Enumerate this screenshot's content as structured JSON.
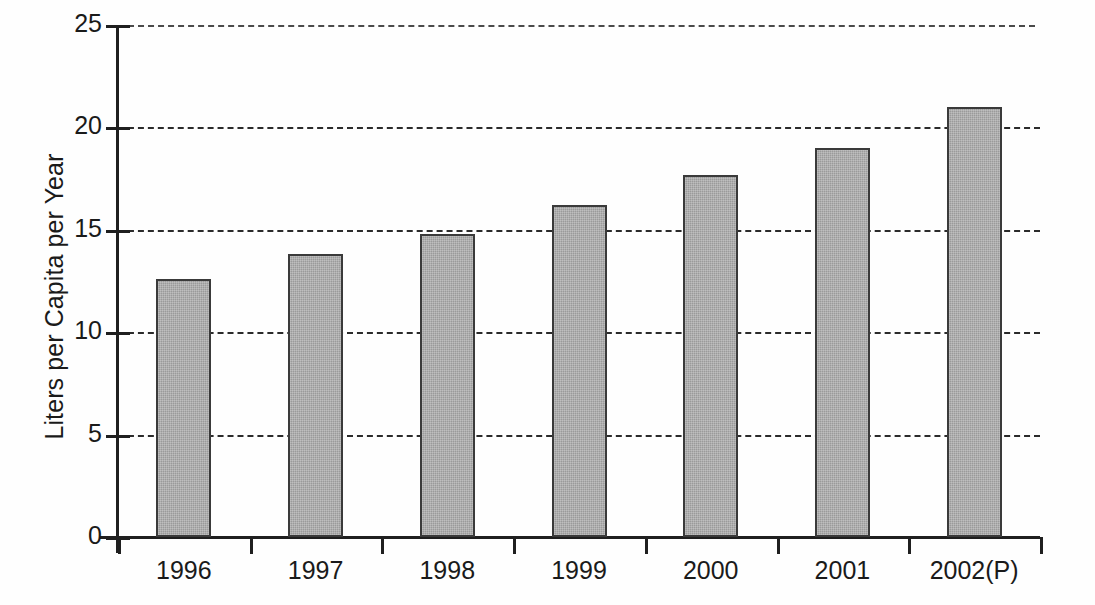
{
  "chart_data": {
    "type": "bar",
    "title": "",
    "subtitle": "",
    "xlabel": "",
    "ylabel": "Liters per Capita per Year",
    "categories": [
      "1996",
      "1997",
      "1998",
      "1999",
      "2000",
      "2001",
      "2002(P)"
    ],
    "values": [
      12.6,
      13.8,
      14.8,
      16.2,
      17.7,
      19.0,
      21.0
    ],
    "ylim": [
      0,
      25
    ],
    "yticks": [
      "0",
      "5",
      "10",
      "15",
      "20",
      "25"
    ],
    "ytick_values": [
      0,
      5,
      10,
      15,
      20,
      25
    ],
    "grid": "horizontal-dashed",
    "legend": "none",
    "annotations": [],
    "series": [
      {
        "name": "Liters per Capita per Year",
        "values": [
          12.6,
          13.8,
          14.8,
          16.2,
          17.7,
          19.0,
          21.0
        ]
      }
    ],
    "colors": {
      "bar_fill": "#9a9a9a",
      "bar_border": "#3a3a3a",
      "axis": "#1f1f1f",
      "grid": "#2b2b2b",
      "text": "#1a1a1a",
      "background": "#fefefe"
    }
  }
}
